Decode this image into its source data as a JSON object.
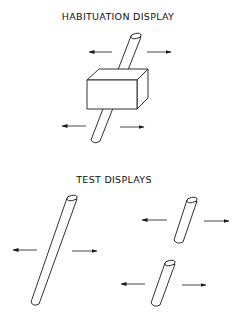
{
  "habituation": {
    "title": "HABITUATION DISPLAY",
    "title_pos": {
      "x": 118,
      "y": 11
    },
    "elements": [
      "rod-behind-box",
      "box-occluder",
      "motion-arrows"
    ]
  },
  "test": {
    "title": "TEST DISPLAYS",
    "title_pos": {
      "x": 114,
      "y": 174
    },
    "elements": [
      "long-rod",
      "broken-rod-top",
      "broken-rod-bottom",
      "motion-arrows"
    ]
  },
  "colors": {
    "line": "#1a1a1a",
    "background": "#ffffff"
  }
}
